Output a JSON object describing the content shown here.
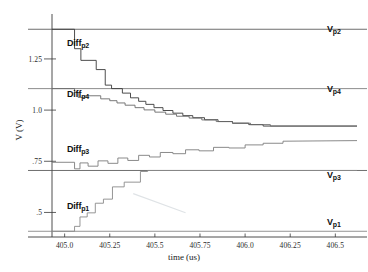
{
  "chart_data": {
    "type": "line",
    "title": "",
    "xlabel": "time (us)",
    "ylabel": "V (V)",
    "xlim": [
      404.93,
      406.62
    ],
    "ylim": [
      0.38,
      1.45
    ],
    "grid": false,
    "legend_position": "inline-annotations",
    "xticks": [
      405.0,
      405.25,
      405.5,
      405.75,
      406.0,
      406.25,
      406.5
    ],
    "xticklabels": [
      "405.0",
      "405.25",
      "405.5",
      "405.75",
      "406.0",
      "406.25",
      "406.5"
    ],
    "yticks": [
      1.25,
      1.0,
      0.75,
      0.5
    ],
    "yticklabels": [
      "1.25",
      "1.0",
      ".75",
      ".5"
    ],
    "reference_levels": [
      {
        "name": "Vp2",
        "label_main": "V",
        "label_sub": "p2",
        "value": 1.395,
        "color": "#4a4a4a"
      },
      {
        "name": "Vp4",
        "label_main": "V",
        "label_sub": "p4",
        "value": 1.105,
        "color": "#6e6e6e"
      },
      {
        "name": "Vp3",
        "label_main": "V",
        "label_sub": "p3",
        "value": 0.705,
        "color": "#4a4a4a"
      },
      {
        "name": "Vp1",
        "label_main": "V",
        "label_sub": "p1",
        "value": 0.408,
        "color": "#7a7a7a"
      }
    ],
    "series": [
      {
        "name": "Diffp2",
        "label_main": "Diff",
        "label_sub": "p2",
        "color": "#3a3a3a",
        "settles_to": 0.922,
        "x": [
          404.93,
          405.055,
          405.055,
          405.09,
          405.09,
          405.175,
          405.175,
          405.225,
          405.225,
          405.26,
          405.26,
          405.32,
          405.32,
          405.365,
          405.365,
          405.41,
          405.41,
          405.45,
          405.45,
          405.495,
          405.495,
          405.545,
          405.545,
          405.6,
          405.6,
          405.655,
          405.655,
          405.71,
          405.71,
          405.775,
          405.775,
          405.85,
          405.85,
          405.93,
          405.93,
          406.02,
          406.02,
          406.1,
          406.1,
          406.62
        ],
        "y": [
          1.395,
          1.395,
          1.3,
          1.3,
          1.243,
          1.243,
          1.198,
          1.198,
          1.122,
          1.122,
          1.105,
          1.105,
          1.083,
          1.083,
          1.06,
          1.06,
          1.043,
          1.043,
          1.028,
          1.028,
          1.012,
          1.012,
          0.998,
          0.998,
          0.985,
          0.985,
          0.973,
          0.973,
          0.963,
          0.963,
          0.953,
          0.953,
          0.944,
          0.944,
          0.936,
          0.936,
          0.929,
          0.929,
          0.922,
          0.922
        ]
      },
      {
        "name": "Diffp4",
        "label_main": "Diff",
        "label_sub": "p4",
        "color": "#6a6a6a",
        "settles_to": 0.922,
        "x": [
          404.93,
          405.055,
          405.055,
          405.075,
          405.075,
          405.11,
          405.11,
          405.2,
          405.2,
          405.25,
          405.25,
          405.29,
          405.29,
          405.335,
          405.335,
          405.39,
          405.39,
          405.44,
          405.44,
          405.5,
          405.5,
          405.56,
          405.56,
          405.62,
          405.62,
          405.69,
          405.69,
          405.76,
          405.76,
          405.84,
          405.84,
          405.93,
          405.93,
          406.03,
          406.03,
          406.14,
          406.14,
          406.62
        ],
        "y": [
          1.105,
          1.105,
          1.088,
          1.088,
          1.062,
          1.062,
          1.07,
          1.07,
          1.055,
          1.055,
          1.046,
          1.046,
          1.035,
          1.035,
          1.024,
          1.024,
          1.012,
          1.012,
          1.001,
          1.001,
          0.99,
          0.99,
          0.98,
          0.98,
          0.97,
          0.97,
          0.961,
          0.961,
          0.952,
          0.952,
          0.944,
          0.944,
          0.936,
          0.936,
          0.929,
          0.929,
          0.922,
          0.922
        ]
      },
      {
        "name": "Diffp3",
        "label_main": "Diff",
        "label_sub": "p3",
        "color": "#7d7d7d",
        "settles_to": 0.851,
        "x": [
          404.93,
          405.055,
          405.055,
          405.085,
          405.085,
          405.13,
          405.13,
          405.185,
          405.185,
          405.24,
          405.24,
          405.295,
          405.295,
          405.35,
          405.35,
          405.41,
          405.41,
          405.47,
          405.47,
          405.53,
          405.53,
          405.6,
          405.6,
          405.67,
          405.67,
          405.745,
          405.745,
          405.825,
          405.825,
          405.91,
          405.91,
          406.0,
          406.0,
          406.1,
          406.1,
          406.21,
          406.21,
          406.62
        ],
        "y": [
          0.745,
          0.745,
          0.713,
          0.713,
          0.742,
          0.742,
          0.726,
          0.726,
          0.752,
          0.752,
          0.74,
          0.74,
          0.766,
          0.766,
          0.754,
          0.754,
          0.779,
          0.779,
          0.771,
          0.771,
          0.793,
          0.793,
          0.787,
          0.787,
          0.806,
          0.806,
          0.801,
          0.801,
          0.818,
          0.818,
          0.815,
          0.815,
          0.83,
          0.83,
          0.838,
          0.838,
          0.848,
          0.851
        ]
      },
      {
        "name": "Diffp1",
        "label_main": "Diff",
        "label_sub": "p1",
        "color": "#8a8a8a",
        "settles_to": 0.705,
        "x": [
          404.93,
          405.055,
          405.055,
          405.085,
          405.085,
          405.125,
          405.125,
          405.17,
          405.17,
          405.215,
          405.215,
          405.265,
          405.265,
          405.33,
          405.33,
          405.42,
          405.42,
          405.46,
          405.46,
          406.62
        ],
        "y": [
          0.408,
          0.408,
          0.432,
          0.432,
          0.478,
          0.478,
          0.498,
          0.498,
          0.545,
          0.545,
          0.565,
          0.565,
          0.625,
          0.625,
          0.648,
          0.648,
          0.7,
          0.7,
          0.705,
          0.705
        ]
      }
    ],
    "annotations": [
      {
        "name": "faint-diagonal-artifact",
        "x0": 405.38,
        "y0": 0.592,
        "x1": 405.67,
        "y1": 0.498
      }
    ]
  },
  "axes": {
    "x_title": "time (us)",
    "y_title": "V (V)"
  }
}
